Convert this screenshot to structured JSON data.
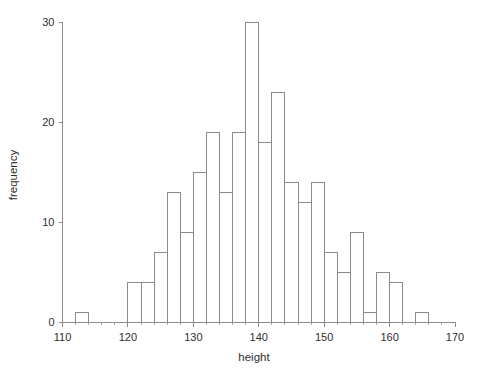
{
  "chart_data": {
    "type": "bar",
    "title": "",
    "subtitle": "",
    "xlabel": "height",
    "ylabel": "frequency",
    "xlim": [
      110,
      170
    ],
    "ylim": [
      0,
      30
    ],
    "grid": false,
    "legend": null,
    "bin_width": 2,
    "xticks": [
      110,
      120,
      130,
      140,
      150,
      160,
      170
    ],
    "xtick_labels": [
      "110",
      "120",
      "130",
      "140",
      "150",
      "160",
      "170"
    ],
    "xminor_ticks": [
      112,
      114,
      116,
      118,
      122,
      124,
      126,
      128,
      132,
      134,
      136,
      138,
      142,
      144,
      146,
      148,
      152,
      154,
      156,
      158,
      162,
      164,
      166,
      168
    ],
    "yticks": [
      0,
      10,
      20,
      30
    ],
    "ytick_labels": [
      "0",
      "10",
      "20",
      "30"
    ],
    "bin_edges": [
      112,
      114,
      120,
      122,
      124,
      126,
      128,
      130,
      132,
      134,
      136,
      138,
      140,
      142,
      144,
      146,
      148,
      150,
      152,
      154,
      156,
      158,
      160,
      162,
      164,
      166
    ],
    "bins": [
      {
        "x0": 112,
        "x1": 114,
        "value": 1
      },
      {
        "x0": 120,
        "x1": 122,
        "value": 4
      },
      {
        "x0": 122,
        "x1": 124,
        "value": 4
      },
      {
        "x0": 124,
        "x1": 126,
        "value": 7
      },
      {
        "x0": 126,
        "x1": 128,
        "value": 13
      },
      {
        "x0": 128,
        "x1": 130,
        "value": 9
      },
      {
        "x0": 130,
        "x1": 132,
        "value": 15
      },
      {
        "x0": 132,
        "x1": 134,
        "value": 19
      },
      {
        "x0": 134,
        "x1": 136,
        "value": 13
      },
      {
        "x0": 136,
        "x1": 138,
        "value": 19
      },
      {
        "x0": 138,
        "x1": 140,
        "value": 30
      },
      {
        "x0": 140,
        "x1": 142,
        "value": 18
      },
      {
        "x0": 142,
        "x1": 144,
        "value": 23
      },
      {
        "x0": 144,
        "x1": 146,
        "value": 14
      },
      {
        "x0": 146,
        "x1": 148,
        "value": 12
      },
      {
        "x0": 148,
        "x1": 150,
        "value": 14
      },
      {
        "x0": 150,
        "x1": 152,
        "value": 7
      },
      {
        "x0": 152,
        "x1": 154,
        "value": 5
      },
      {
        "x0": 154,
        "x1": 156,
        "value": 9
      },
      {
        "x0": 156,
        "x1": 158,
        "value": 1
      },
      {
        "x0": 158,
        "x1": 160,
        "value": 5
      },
      {
        "x0": 160,
        "x1": 162,
        "value": 4
      },
      {
        "x0": 164,
        "x1": 166,
        "value": 1
      }
    ],
    "categories": [
      "112-114",
      "120-122",
      "122-124",
      "124-126",
      "126-128",
      "128-130",
      "130-132",
      "132-134",
      "134-136",
      "136-138",
      "138-140",
      "140-142",
      "142-144",
      "144-146",
      "146-148",
      "148-150",
      "150-152",
      "152-154",
      "154-156",
      "156-158",
      "158-160",
      "160-162",
      "164-166"
    ],
    "values": [
      1,
      4,
      4,
      7,
      13,
      9,
      15,
      19,
      13,
      19,
      30,
      18,
      23,
      14,
      12,
      14,
      7,
      5,
      9,
      1,
      5,
      4,
      1
    ],
    "colors": {
      "bar_stroke": "#8a8a8a",
      "bar_fill": "none",
      "axis": "#8d8d8d",
      "text": "#2f2f2f",
      "background": "#ffffff"
    }
  }
}
